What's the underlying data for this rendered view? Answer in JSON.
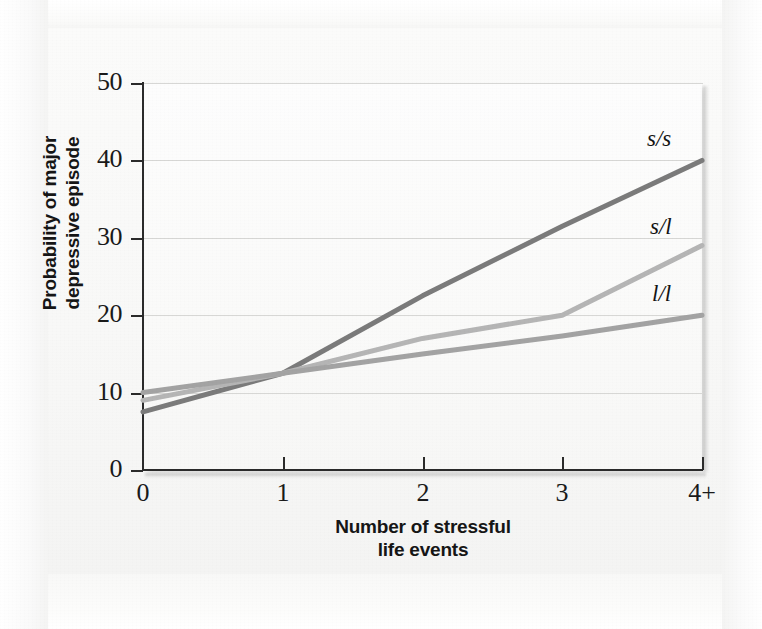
{
  "figure": {
    "background_color": "#f7f7f6",
    "plot_background_color": "#fcfcfb",
    "axis_color": "#2b2b2b",
    "gridline_color": "#d7d7d5"
  },
  "chart_data": {
    "type": "line",
    "title": "",
    "xlabel_line1": "Number of stressful",
    "xlabel_line2": "life events",
    "ylabel_line1": "Probability of major",
    "ylabel_line2": "depressive episode",
    "categories": [
      "0",
      "1",
      "2",
      "3",
      "4+"
    ],
    "x": [
      0,
      1,
      2,
      3,
      4
    ],
    "xlim": [
      0,
      4
    ],
    "ylim": [
      0,
      50
    ],
    "yticks": [
      0,
      10,
      20,
      30,
      40,
      50
    ],
    "ytick_labels": [
      "0",
      "10",
      "20",
      "30",
      "40",
      "50"
    ],
    "grid": "horizontal",
    "legend_position": "inline-right-of-line-ends",
    "series": [
      {
        "name": "s/s",
        "label": "s/s",
        "color": "#7b7b7b",
        "values": [
          7.5,
          12.5,
          22.5,
          31.5,
          40
        ]
      },
      {
        "name": "s/l",
        "label": "s/l",
        "color": "#b5b5b5",
        "values": [
          9,
          12.5,
          17,
          20,
          29
        ]
      },
      {
        "name": "l/l",
        "label": "l/l",
        "color": "#a3a3a3",
        "values": [
          10,
          12.5,
          15,
          17.3,
          20
        ]
      }
    ]
  }
}
